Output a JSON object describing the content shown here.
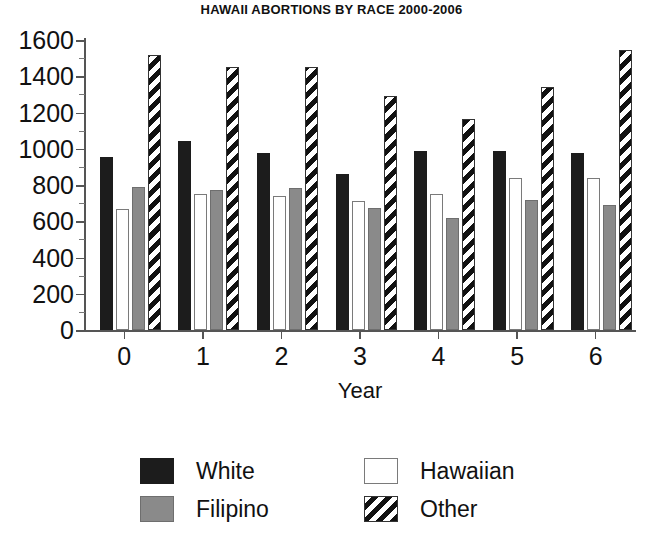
{
  "chart_data": {
    "type": "bar",
    "title": "HAWAII ABORTIONS BY RACE 2000-2006",
    "xlabel": "Year",
    "ylabel": "",
    "categories": [
      "0",
      "1",
      "2",
      "3",
      "4",
      "5",
      "6"
    ],
    "ylim": [
      0,
      1600
    ],
    "ytick_step": 200,
    "yminor_step": 100,
    "grid": false,
    "legend_position": "bottom",
    "ytick_labels": [
      "0",
      "200",
      "400",
      "600",
      "800",
      "1000",
      "1200",
      "1400",
      "1600"
    ],
    "xtick_labels": [
      "0",
      "1",
      "2",
      "3",
      "4",
      "5",
      "6"
    ],
    "series": [
      {
        "name": "White",
        "fill": "solid-black",
        "color": "#1c1c1c",
        "values": [
          955,
          1045,
          975,
          860,
          985,
          985,
          975
        ]
      },
      {
        "name": "Hawaiian",
        "fill": "empty-white",
        "color": "#ffffff",
        "values": [
          670,
          750,
          740,
          710,
          750,
          840,
          840
        ]
      },
      {
        "name": "Filipino",
        "fill": "solid-gray",
        "color": "#8a8a8a",
        "values": [
          790,
          775,
          785,
          675,
          620,
          720,
          690
        ]
      },
      {
        "name": "Other",
        "fill": "diagonal-hatch",
        "color": "#111111",
        "values": [
          1520,
          1450,
          1450,
          1290,
          1165,
          1340,
          1545
        ]
      }
    ]
  }
}
